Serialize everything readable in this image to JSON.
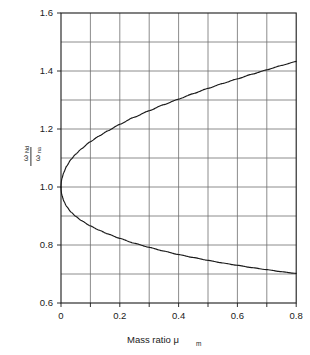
{
  "chart_data": {
    "type": "line",
    "title": "",
    "xlabel": "Mass ratio μ",
    "xlabel_sub": "m",
    "ylabel_numerator": "ω",
    "ylabel_numerator_sub": "Nd",
    "ylabel_denominator": "ω",
    "ylabel_denominator_sub": "na",
    "xlim": [
      0,
      0.8
    ],
    "ylim": [
      0.6,
      1.6
    ],
    "grid": true,
    "grid_step_x": 0.1,
    "grid_step_y": 0.1,
    "legend": "none",
    "xticks": [
      0,
      0.1,
      0.2,
      0.3,
      0.4,
      0.5,
      0.6,
      0.7,
      0.8
    ],
    "xtick_labels": [
      "0",
      "",
      "0.2",
      "",
      "0.4",
      "",
      "0.6",
      "",
      "0.8"
    ],
    "yticks": [
      0.6,
      0.7,
      0.8,
      0.9,
      1.0,
      1.1,
      1.2,
      1.3,
      1.4,
      1.5,
      1.6
    ],
    "ytick_labels": [
      "0.6",
      "",
      "0.8",
      "",
      "1.0",
      "",
      "1.2",
      "",
      "1.4",
      "",
      "1.6"
    ],
    "line_color": "#1a1a1a",
    "grid_color": "#6e6e6e",
    "axis_color": "#1a1a1a",
    "series": [
      {
        "name": "upper branch",
        "x": [
          0,
          0.005,
          0.01,
          0.02,
          0.03,
          0.04,
          0.05,
          0.06,
          0.08,
          0.1,
          0.125,
          0.15,
          0.175,
          0.2,
          0.25,
          0.3,
          0.35,
          0.4,
          0.45,
          0.5,
          0.55,
          0.6,
          0.65,
          0.7,
          0.75,
          0.8
        ],
        "values": [
          1.0,
          1.036,
          1.051,
          1.072,
          1.088,
          1.101,
          1.113,
          1.123,
          1.141,
          1.157,
          1.174,
          1.19,
          1.205,
          1.218,
          1.243,
          1.266,
          1.287,
          1.307,
          1.326,
          1.344,
          1.361,
          1.377,
          1.393,
          1.408,
          1.423,
          1.437
        ]
      },
      {
        "name": "lower branch",
        "x": [
          0,
          0.005,
          0.01,
          0.02,
          0.03,
          0.04,
          0.05,
          0.06,
          0.08,
          0.1,
          0.125,
          0.15,
          0.175,
          0.2,
          0.25,
          0.3,
          0.35,
          0.4,
          0.45,
          0.5,
          0.55,
          0.6,
          0.65,
          0.7,
          0.75,
          0.8
        ],
        "values": [
          1.0,
          0.965,
          0.951,
          0.932,
          0.919,
          0.908,
          0.899,
          0.891,
          0.877,
          0.865,
          0.852,
          0.84,
          0.83,
          0.821,
          0.805,
          0.79,
          0.777,
          0.765,
          0.754,
          0.744,
          0.735,
          0.726,
          0.718,
          0.71,
          0.703,
          0.696
        ]
      }
    ],
    "curve_points_upper": [
      [
        0.0,
        1.0
      ],
      [
        0.004,
        1.032
      ],
      [
        0.01,
        1.051
      ],
      [
        0.02,
        1.073
      ],
      [
        0.035,
        1.096
      ],
      [
        0.05,
        1.113
      ],
      [
        0.07,
        1.132
      ],
      [
        0.1,
        1.156
      ],
      [
        0.13,
        1.176
      ],
      [
        0.16,
        1.194
      ],
      [
        0.2,
        1.216
      ],
      [
        0.25,
        1.241
      ],
      [
        0.3,
        1.263
      ],
      [
        0.35,
        1.284
      ],
      [
        0.4,
        1.303
      ],
      [
        0.45,
        1.322
      ],
      [
        0.5,
        1.34
      ],
      [
        0.55,
        1.357
      ],
      [
        0.6,
        1.373
      ],
      [
        0.65,
        1.389
      ],
      [
        0.7,
        1.404
      ],
      [
        0.75,
        1.419
      ],
      [
        0.8,
        1.433
      ]
    ],
    "curve_points_lower": [
      [
        0.0,
        1.0
      ],
      [
        0.004,
        0.969
      ],
      [
        0.01,
        0.951
      ],
      [
        0.02,
        0.932
      ],
      [
        0.035,
        0.913
      ],
      [
        0.05,
        0.899
      ],
      [
        0.07,
        0.884
      ],
      [
        0.1,
        0.866
      ],
      [
        0.13,
        0.851
      ],
      [
        0.16,
        0.838
      ],
      [
        0.2,
        0.823
      ],
      [
        0.25,
        0.806
      ],
      [
        0.3,
        0.792
      ],
      [
        0.35,
        0.779
      ],
      [
        0.4,
        0.767
      ],
      [
        0.45,
        0.757
      ],
      [
        0.5,
        0.747
      ],
      [
        0.55,
        0.738
      ],
      [
        0.6,
        0.73
      ],
      [
        0.65,
        0.722
      ],
      [
        0.7,
        0.715
      ],
      [
        0.75,
        0.708
      ],
      [
        0.8,
        0.702
      ]
    ]
  },
  "axes": {
    "x_label_main": "Mass ratio μ",
    "x_label_subscript": "m",
    "y_label_num_main": "ω",
    "y_label_num_sub": "Nd",
    "y_label_den_main": "ω",
    "y_label_den_sub": "na",
    "x_tick_0": "0",
    "x_tick_1": "0.2",
    "x_tick_2": "0.4",
    "x_tick_3": "0.6",
    "x_tick_4": "0.8",
    "y_tick_0": "0.6",
    "y_tick_1": "0.8",
    "y_tick_2": "1.0",
    "y_tick_3": "1.2",
    "y_tick_4": "1.4",
    "y_tick_5": "1.6"
  },
  "colors": {
    "background": "#ffffff",
    "grid": "#6e6e6e",
    "axis": "#1a1a1a",
    "curve": "#1a1a1a"
  }
}
